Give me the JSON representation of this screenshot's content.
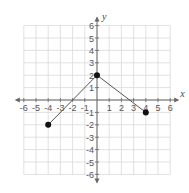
{
  "chart_data": {
    "type": "line",
    "title": "",
    "xlabel": "x",
    "ylabel": "y",
    "xlim": [
      -6,
      6
    ],
    "ylim": [
      -6,
      6
    ],
    "grid": true,
    "x_ticks": [
      -6,
      -5,
      -4,
      -3,
      -2,
      -1,
      1,
      2,
      3,
      4,
      5,
      6
    ],
    "y_ticks": [
      -6,
      -5,
      -4,
      -3,
      -2,
      -1,
      1,
      2,
      3,
      4,
      5,
      6
    ],
    "series": [
      {
        "name": "piecewise linear",
        "points": [
          [
            -4,
            -2
          ],
          [
            0,
            2
          ],
          [
            4,
            -1
          ]
        ],
        "endpoints": "closed",
        "color": "#333333"
      }
    ],
    "colors": {
      "grid": "#d9d9d9",
      "axis": "#666666",
      "line": "#555555",
      "point": "#111111"
    }
  }
}
